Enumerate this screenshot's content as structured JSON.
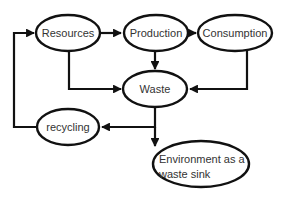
{
  "diagram": {
    "nodes": [
      {
        "id": "resources",
        "label": "Resources"
      },
      {
        "id": "production",
        "label": "Production"
      },
      {
        "id": "consumption",
        "label": "Consumption"
      },
      {
        "id": "waste",
        "label": "Waste"
      },
      {
        "id": "recycling",
        "label": "recycling"
      },
      {
        "id": "environment",
        "label_line1": "Environment as a",
        "label_line2": "waste sink"
      }
    ],
    "edges": [
      {
        "from": "resources",
        "to": "production"
      },
      {
        "from": "production",
        "to": "consumption"
      },
      {
        "from": "resources",
        "to": "waste"
      },
      {
        "from": "production",
        "to": "waste"
      },
      {
        "from": "consumption",
        "to": "waste"
      },
      {
        "from": "waste",
        "to": "recycling"
      },
      {
        "from": "waste",
        "to": "environment"
      },
      {
        "from": "recycling",
        "to": "resources"
      }
    ]
  }
}
